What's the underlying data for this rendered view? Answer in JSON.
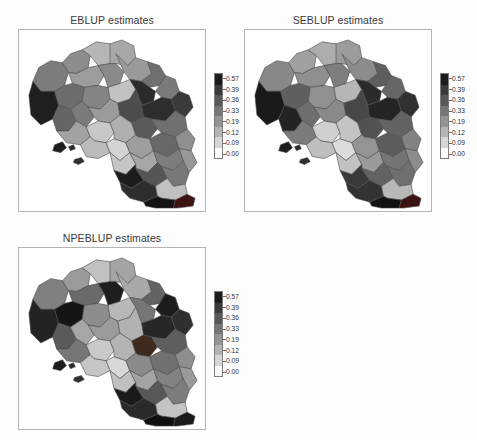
{
  "figure": {
    "background_color": "#fdfdfd",
    "border_color": "#b4b4b4"
  },
  "legend": {
    "tick_labels": [
      "0.57",
      "0.39",
      "0.36",
      "0.33",
      "0.19",
      "0.12",
      "0.09",
      "0.00"
    ],
    "colors": [
      "#1b1b1b",
      "#3a3a3a",
      "#585858",
      "#767676",
      "#949494",
      "#b4b4b4",
      "#d6d6d6",
      "#fbfbfb"
    ],
    "orientation": "vertical",
    "min": "0.00",
    "max": "0.57"
  },
  "panels": [
    {
      "id": "eblup",
      "title": "EBLUP estimates",
      "region": "Campania"
    },
    {
      "id": "seblup",
      "title": "SEBLUP estimates",
      "region": "Campania"
    },
    {
      "id": "npeblup",
      "title": "NPEBLUP estimates",
      "region": "Campania"
    }
  ],
  "chart_data": {
    "type": "heatmap",
    "subtype": "choropleth-map-grid",
    "title": "",
    "panel_titles": [
      "EBLUP estimates",
      "SEBLUP estimates",
      "NPEBLUP estimates"
    ],
    "legend_title": "",
    "legend_ticks": [
      "0.57",
      "0.39",
      "0.36",
      "0.33",
      "0.19",
      "0.12",
      "0.09",
      "0.00"
    ],
    "value_range": [
      0.0,
      0.57
    ],
    "colormap": "grayscale-reversed",
    "grid": false,
    "legend_position": "right-of-each-panel",
    "areas": [
      "Alta Irpinia",
      "Alto Casertano",
      "Alto Sele",
      "Antica Volcei",
      "Area Nolana",
      "Area Sud Ovest",
      "Avellinese",
      "Baronia",
      "Calore Salernitano",
      "Caserta",
      "Cilento Centrale",
      "Cilento Interno",
      "Cilento Nord",
      "Costa del Vesuvio",
      "Fortore",
      "Gaudo",
      "Irno",
      "Lago Laceno",
      "Litorale Domitio",
      "Matese",
      "Monti Picentini",
      "Napoli",
      "Partenio",
      "Penisola Sorrentina",
      "Piana del Sele",
      "Sannio",
      "Tammaro",
      "Taburno",
      "Titerno",
      "Ufita",
      "Vallo di Diano"
    ],
    "series": [
      {
        "name": "EBLUP estimates",
        "values": [
          0.52,
          0.31,
          0.46,
          0.57,
          0.22,
          0.18,
          0.35,
          0.5,
          0.29,
          0.24,
          0.41,
          0.49,
          0.33,
          0.15,
          0.44,
          0.27,
          0.2,
          0.38,
          0.55,
          0.3,
          0.36,
          0.12,
          0.42,
          0.09,
          0.26,
          0.34,
          0.47,
          0.21,
          0.39,
          0.45,
          0.53
        ]
      },
      {
        "name": "SEBLUP estimates",
        "values": [
          0.5,
          0.33,
          0.44,
          0.55,
          0.24,
          0.19,
          0.37,
          0.48,
          0.31,
          0.26,
          0.4,
          0.47,
          0.35,
          0.17,
          0.43,
          0.28,
          0.22,
          0.36,
          0.53,
          0.32,
          0.34,
          0.14,
          0.41,
          0.11,
          0.27,
          0.33,
          0.45,
          0.23,
          0.38,
          0.44,
          0.51
        ]
      },
      {
        "name": "NPEBLUP estimates",
        "values": [
          0.54,
          0.3,
          0.48,
          0.57,
          0.21,
          0.16,
          0.34,
          0.52,
          0.28,
          0.23,
          0.43,
          0.51,
          0.32,
          0.13,
          0.46,
          0.25,
          0.18,
          0.4,
          0.56,
          0.29,
          0.37,
          0.1,
          0.44,
          0.08,
          0.24,
          0.35,
          0.49,
          0.2,
          0.41,
          0.47,
          0.55
        ]
      }
    ]
  }
}
